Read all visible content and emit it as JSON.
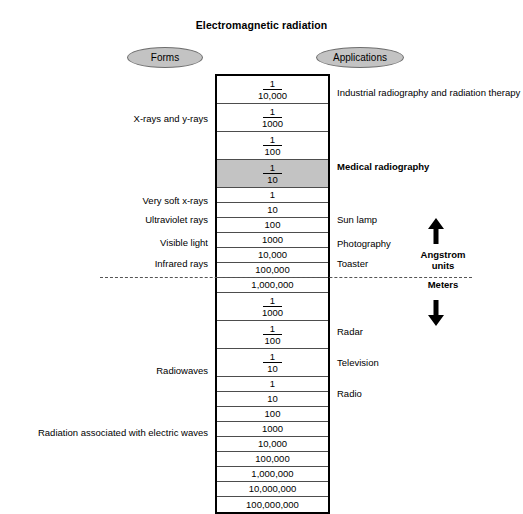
{
  "title": "Electromagnetic radiation",
  "headers": {
    "forms": "Forms",
    "applications": "Applications"
  },
  "colors": {
    "highlight_row": "#c3c3c3",
    "ellipse_fill": "#c3c3c3",
    "ellipse_border": "#6e6e6e",
    "table_border": "#000000",
    "row_line": "#4d4d4d",
    "dashed_divider": "#555555"
  },
  "scale": {
    "rows": [
      {
        "id": "r1",
        "kind": "fraction",
        "numerator": "1",
        "denominator": "10,000",
        "highlight": false
      },
      {
        "id": "r2",
        "kind": "fraction",
        "numerator": "1",
        "denominator": "1000",
        "highlight": false
      },
      {
        "id": "r3",
        "kind": "fraction",
        "numerator": "1",
        "denominator": "100",
        "highlight": false
      },
      {
        "id": "r4",
        "kind": "fraction",
        "numerator": "1",
        "denominator": "10",
        "highlight": true
      },
      {
        "id": "r5",
        "kind": "plain",
        "value": "1",
        "highlight": false
      },
      {
        "id": "r6",
        "kind": "plain",
        "value": "10",
        "highlight": false
      },
      {
        "id": "r7",
        "kind": "plain",
        "value": "100",
        "highlight": false
      },
      {
        "id": "r8",
        "kind": "plain",
        "value": "1000",
        "highlight": false
      },
      {
        "id": "r9",
        "kind": "plain",
        "value": "10,000",
        "highlight": false
      },
      {
        "id": "r10",
        "kind": "plain",
        "value": "100,000",
        "highlight": false
      },
      {
        "id": "r11",
        "kind": "plain",
        "value": "1,000,000",
        "highlight": false
      },
      {
        "id": "r12",
        "kind": "fraction",
        "numerator": "1",
        "denominator": "1000",
        "highlight": false
      },
      {
        "id": "r13",
        "kind": "fraction",
        "numerator": "1",
        "denominator": "100",
        "highlight": false
      },
      {
        "id": "r14",
        "kind": "fraction",
        "numerator": "1",
        "denominator": "10",
        "highlight": false
      },
      {
        "id": "r15",
        "kind": "plain",
        "value": "1",
        "highlight": false
      },
      {
        "id": "r16",
        "kind": "plain",
        "value": "10",
        "highlight": false
      },
      {
        "id": "r17",
        "kind": "plain",
        "value": "100",
        "highlight": false
      },
      {
        "id": "r18",
        "kind": "plain",
        "value": "1000",
        "highlight": false
      },
      {
        "id": "r19",
        "kind": "plain",
        "value": "10,000",
        "highlight": false
      },
      {
        "id": "r20",
        "kind": "plain",
        "value": "100,000",
        "highlight": false
      },
      {
        "id": "r21",
        "kind": "plain",
        "value": "1,000,000",
        "highlight": false
      },
      {
        "id": "r22",
        "kind": "plain",
        "value": "10,000,000",
        "highlight": false
      },
      {
        "id": "r23",
        "kind": "plain",
        "value": "100,000,000",
        "highlight": false
      }
    ]
  },
  "forms": [
    {
      "label": "X-rays and y-rays",
      "top": 114
    },
    {
      "label": "Very soft x-rays",
      "top": 196
    },
    {
      "label": "Ultraviolet rays",
      "top": 215
    },
    {
      "label": "Visible light",
      "top": 238
    },
    {
      "label": "Infrared rays",
      "top": 259
    },
    {
      "label": "Radiowaves",
      "top": 366
    },
    {
      "label": "Radiation associated with electric waves",
      "top": 428
    }
  ],
  "applications": [
    {
      "label": "Industrial radiography and radiation therapy",
      "top": 88,
      "bold": false
    },
    {
      "label": "Medical radiography",
      "top": 162,
      "bold": true
    },
    {
      "label": "Sun lamp",
      "top": 215,
      "bold": false
    },
    {
      "label": "Photography",
      "top": 239,
      "bold": false
    },
    {
      "label": "Toaster",
      "top": 259,
      "bold": false
    },
    {
      "label": "Radar",
      "top": 327,
      "bold": false
    },
    {
      "label": "Television",
      "top": 358,
      "bold": false
    },
    {
      "label": "Radio",
      "top": 389,
      "bold": false
    }
  ],
  "units": {
    "above": "Angstrom\nunits",
    "above_line1": "Angstrom",
    "above_line2": "units",
    "below": "Meters",
    "arrow_up": "arrow-up-icon",
    "arrow_down": "arrow-down-icon"
  }
}
